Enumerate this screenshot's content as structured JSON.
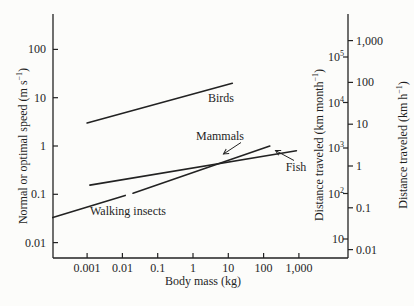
{
  "colors": {
    "ink": "#222222",
    "background": "#fcfcfa"
  },
  "chart_data": {
    "type": "line",
    "title": "",
    "xlabel": "Body mass (kg)",
    "log_log": true,
    "grid": false,
    "axes": {
      "x": {
        "scale": "log",
        "range": [
          0.0001,
          20000
        ],
        "ticks": [
          {
            "t": "0.001",
            "v": 0.001
          },
          {
            "t": "0.01",
            "v": 0.01
          },
          {
            "t": "0.1",
            "v": 0.1
          },
          {
            "t": "1",
            "v": 1
          },
          {
            "t": "10",
            "v": 10
          },
          {
            "t": "100",
            "v": 100
          },
          {
            "t": "1,000",
            "v": 1000
          }
        ]
      },
      "left": {
        "scale": "log",
        "label_pre": "Normal or optimal speed (m s",
        "label_sup": "−1",
        "label_post": ")",
        "range": [
          0.005,
          500
        ],
        "ticks": [
          {
            "t": "100",
            "v": 100
          },
          {
            "t": "10",
            "v": 10
          },
          {
            "t": "1",
            "v": 1
          },
          {
            "t": "0.1",
            "v": 0.1
          },
          {
            "t": "0.01",
            "v": 0.01
          }
        ]
      },
      "right_month": {
        "scale": "log",
        "label_pre": "Distance traveled (km month",
        "label_sup": "−1",
        "label_post": ")",
        "ticks": [
          {
            "t": "10",
            "e": "5",
            "v": 100000
          },
          {
            "t": "10",
            "e": "4",
            "v": 10000
          },
          {
            "t": "10",
            "e": "3",
            "v": 1000
          },
          {
            "t": "10",
            "e": "2",
            "v": 100
          },
          {
            "t": "10",
            "e": "",
            "v": 10
          }
        ]
      },
      "right_hour": {
        "scale": "log",
        "label_pre": "Distance traveled (km h",
        "label_sup": "−1",
        "label_post": ")",
        "ticks": [
          {
            "t": "1,000",
            "v": 1000
          },
          {
            "t": "100",
            "v": 100
          },
          {
            "t": "10",
            "v": 10
          },
          {
            "t": "1",
            "v": 1
          },
          {
            "t": "0.1",
            "v": 0.1
          },
          {
            "t": "0.01",
            "v": 0.01
          }
        ]
      }
    },
    "series": [
      {
        "name": "Birds",
        "points": [
          [
            0.001,
            3
          ],
          [
            13,
            20
          ]
        ]
      },
      {
        "name": "Mammals",
        "points": [
          [
            0.02,
            0.105
          ],
          [
            150,
            1.0
          ]
        ]
      },
      {
        "name": "Fish",
        "points": [
          [
            0.0012,
            0.155
          ],
          [
            850,
            0.8
          ]
        ]
      },
      {
        "name": "Walking insects",
        "points": [
          [
            0.000107,
            0.033
          ],
          [
            0.012,
            0.095
          ]
        ]
      }
    ]
  }
}
